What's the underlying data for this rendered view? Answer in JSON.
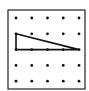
{
  "diagram": {
    "type": "geoboard-dot-grid",
    "rows": 5,
    "cols": 5,
    "frame": {
      "x": 8,
      "y": 10,
      "w": 77,
      "h": 79
    },
    "origin": {
      "x": 16,
      "y": 18
    },
    "spacing": {
      "x": 15.75,
      "y": 15.8
    },
    "dot_radius": 1.4,
    "colors": {
      "frame": "#222222",
      "dot": "#111111",
      "line": "#111111",
      "background": "#ffffff"
    },
    "triangle": {
      "vertices": [
        [
          0,
          1
        ],
        [
          0,
          2
        ],
        [
          4,
          2
        ]
      ],
      "description": "right triangle with vertical leg of 1 unit and horizontal leg of 4 units"
    }
  }
}
